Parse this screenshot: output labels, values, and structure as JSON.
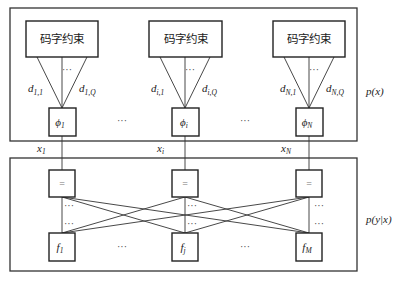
{
  "diagram": {
    "top_block": {
      "label": "p(x)",
      "constraints": [
        {
          "label": "码字约束",
          "edge_left": {
            "base": "d",
            "sub": "1,1"
          },
          "edge_right": {
            "base": "d",
            "sub": "1,Q"
          },
          "dots": "···",
          "phi": {
            "base": "ϕ",
            "sub": "1"
          }
        },
        {
          "label": "码字约束",
          "edge_left": {
            "base": "d",
            "sub": "i,1"
          },
          "edge_right": {
            "base": "d",
            "sub": "i,Q"
          },
          "dots": "···",
          "phi": {
            "base": "ϕ",
            "sub": "i"
          }
        },
        {
          "label": "码字约束",
          "edge_left": {
            "base": "d",
            "sub": "N,1"
          },
          "edge_right": {
            "base": "d",
            "sub": "N,Q"
          },
          "dots": "···",
          "phi": {
            "base": "ϕ",
            "sub": "N"
          }
        }
      ],
      "between_dots": [
        "···",
        "···"
      ]
    },
    "variables": [
      {
        "base": "x",
        "sub": "1"
      },
      {
        "base": "x",
        "sub": "i"
      },
      {
        "base": "x",
        "sub": "N"
      }
    ],
    "bottom_block": {
      "label": "p(y|x)",
      "equality_nodes": [
        "=",
        "=",
        "="
      ],
      "factor_nodes": [
        {
          "base": "f",
          "sub": "1"
        },
        {
          "base": "f",
          "sub": "j"
        },
        {
          "base": "f",
          "sub": "M"
        }
      ],
      "vertical_dots": "···",
      "between_dots": [
        "···",
        "···"
      ]
    }
  }
}
